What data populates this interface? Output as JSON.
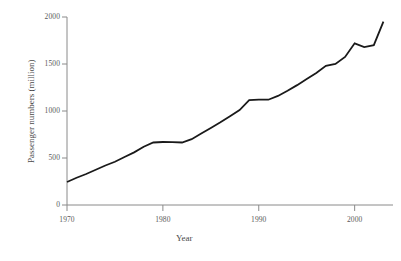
{
  "chart_data": {
    "type": "line",
    "title": "",
    "xlabel": "Year",
    "ylabel": "Passenger numbers (million)",
    "xlim": [
      1970,
      2004
    ],
    "ylim": [
      0,
      2000
    ],
    "grid": false,
    "legend": false,
    "x_ticks": [
      1970,
      1980,
      1990,
      2000
    ],
    "x_tick_labels": [
      "1970",
      "1980",
      "1990",
      "2000"
    ],
    "y_ticks": [
      0,
      500,
      1000,
      1500,
      2000
    ],
    "y_tick_labels": [
      "0",
      "500",
      "1000",
      "1500",
      "2000"
    ],
    "series": [
      {
        "name": "Passenger numbers",
        "color": "#1a1a1a",
        "x": [
          1970,
          1971,
          1972,
          1973,
          1974,
          1975,
          1976,
          1977,
          1978,
          1979,
          1980,
          1981,
          1982,
          1983,
          1984,
          1985,
          1986,
          1987,
          1988,
          1989,
          1990,
          1991,
          1992,
          1993,
          1994,
          1995,
          1996,
          1997,
          1998,
          1999,
          2000,
          2001,
          2002,
          2003
        ],
        "values": [
          245,
          290,
          330,
          375,
          420,
          460,
          510,
          560,
          620,
          665,
          670,
          668,
          665,
          700,
          760,
          820,
          880,
          945,
          1010,
          1115,
          1120,
          1120,
          1160,
          1215,
          1275,
          1340,
          1405,
          1480,
          1500,
          1575,
          1720,
          1680,
          1700,
          1950
        ]
      }
    ]
  },
  "axis": {
    "x_title": "Year",
    "y_title": "Passenger numbers (million)"
  },
  "colors": {
    "line": "#1a1a1a",
    "axis": "#8a8a8a",
    "tick_text": "#5a5a5a",
    "background": "#ffffff"
  }
}
